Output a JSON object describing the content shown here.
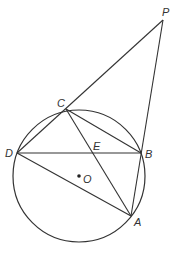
{
  "diagram": {
    "stroke_color": "#333333",
    "circle": {
      "center_label": "O",
      "cx": 79,
      "cy": 176,
      "r": 66
    },
    "points": {
      "P": {
        "x": 163,
        "y": 20,
        "label": "P",
        "lx": 162,
        "ly": 16
      },
      "C": {
        "x": 66,
        "y": 109,
        "label": "C",
        "lx": 57,
        "ly": 107
      },
      "D": {
        "x": 17,
        "y": 153,
        "label": "D",
        "lx": 5,
        "ly": 157
      },
      "B": {
        "x": 141,
        "y": 153,
        "label": "B",
        "lx": 145,
        "ly": 158
      },
      "A": {
        "x": 131,
        "y": 216,
        "label": "A",
        "lx": 134,
        "ly": 226
      },
      "E": {
        "x": 93,
        "y": 153,
        "label": "E",
        "lx": 93,
        "ly": 150
      },
      "O": {
        "x": 79,
        "y": 176,
        "label": "O",
        "lx": 83,
        "ly": 183
      }
    },
    "segments": [
      [
        "P",
        "D"
      ],
      [
        "P",
        "A"
      ],
      [
        "C",
        "B"
      ],
      [
        "C",
        "A"
      ],
      [
        "D",
        "B"
      ],
      [
        "D",
        "A"
      ]
    ],
    "labels": [
      "P",
      "C",
      "D",
      "E",
      "B",
      "O",
      "A"
    ]
  }
}
